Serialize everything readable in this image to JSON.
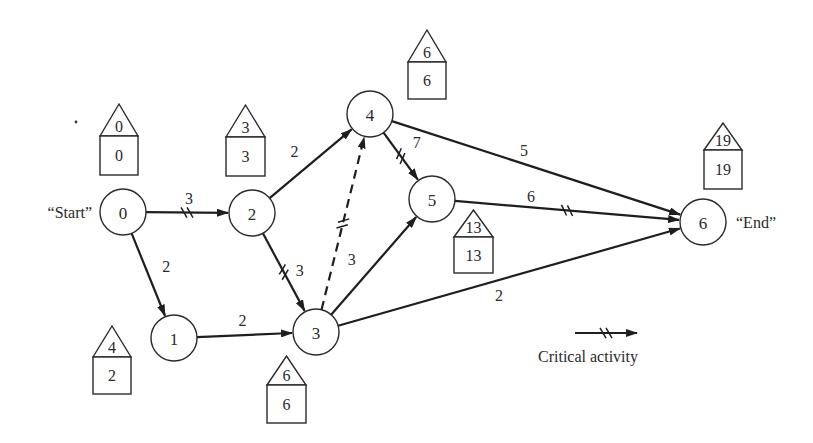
{
  "diagram": {
    "type": "critical-path-network",
    "colors": {
      "ink": "#1e1e1e",
      "background": "#ffffff"
    },
    "nodes": [
      {
        "id": "0",
        "label": "0",
        "x": 123,
        "y": 212,
        "side_label": "“Start”",
        "side": "left",
        "house": {
          "x": 100,
          "top": 104,
          "roof_base": 136,
          "bottom": 175,
          "width": 38,
          "late": "0",
          "early": "0"
        }
      },
      {
        "id": "1",
        "label": "1",
        "x": 174,
        "y": 338,
        "house": {
          "x": 93,
          "top": 326,
          "roof_base": 357,
          "bottom": 394,
          "width": 38,
          "late": "4",
          "early": "2"
        }
      },
      {
        "id": "2",
        "label": "2",
        "x": 252,
        "y": 213,
        "house": {
          "x": 226,
          "top": 105,
          "roof_base": 137,
          "bottom": 176,
          "width": 39,
          "late": "3",
          "early": "3"
        }
      },
      {
        "id": "3",
        "label": "3",
        "x": 316,
        "y": 332,
        "house": {
          "x": 267,
          "top": 356,
          "roof_base": 385,
          "bottom": 423,
          "width": 39,
          "late": "6",
          "early": "6"
        }
      },
      {
        "id": "4",
        "label": "4",
        "x": 370,
        "y": 114,
        "house": {
          "x": 408,
          "top": 30,
          "roof_base": 62,
          "bottom": 99,
          "width": 38,
          "late": "6",
          "early": "6"
        }
      },
      {
        "id": "5",
        "label": "5",
        "x": 432,
        "y": 199,
        "house": {
          "x": 454,
          "top": 210,
          "roof_base": 237,
          "bottom": 273,
          "width": 39,
          "late": "13",
          "early": "13"
        }
      },
      {
        "id": "6",
        "label": "6",
        "x": 703,
        "y": 222,
        "side_label": "“End”",
        "side": "right",
        "house": {
          "x": 704,
          "top": 123,
          "roof_base": 150,
          "bottom": 189,
          "width": 38,
          "late": "19",
          "early": "19"
        }
      }
    ],
    "node_radius": 23,
    "edges": [
      {
        "from": "0",
        "to": "2",
        "duration": "3",
        "critical": true,
        "dashed": false,
        "label_dx": 2,
        "label_dy": -14
      },
      {
        "from": "0",
        "to": "1",
        "duration": "2",
        "critical": false,
        "dashed": false,
        "label_dx": 18,
        "label_dy": -8
      },
      {
        "from": "2",
        "to": "4",
        "duration": "2",
        "critical": false,
        "dashed": false,
        "label_dx": -16,
        "label_dy": -12
      },
      {
        "from": "2",
        "to": "3",
        "duration": "3",
        "critical": true,
        "dashed": false,
        "label_dx": 16,
        "label_dy": -2
      },
      {
        "from": "1",
        "to": "3",
        "duration": "2",
        "critical": false,
        "dashed": false,
        "label_dx": -2,
        "label_dy": -15
      },
      {
        "from": "3",
        "to": "4",
        "duration": "",
        "critical": true,
        "dashed": true,
        "label_dx": 0,
        "label_dy": 0
      },
      {
        "from": "4",
        "to": "5",
        "duration": "7",
        "critical": true,
        "dashed": false,
        "label_dx": 16,
        "label_dy": -14
      },
      {
        "from": "3",
        "to": "5",
        "duration": "3",
        "critical": false,
        "dashed": false,
        "label_dx": -22,
        "label_dy": -6
      },
      {
        "from": "4",
        "to": "6",
        "duration": "5",
        "critical": false,
        "dashed": false,
        "label_dx": -12,
        "label_dy": -17
      },
      {
        "from": "5",
        "to": "6",
        "duration": "6",
        "critical": true,
        "dashed": false,
        "label_dx": -36,
        "label_dy": -14
      },
      {
        "from": "3",
        "to": "6",
        "duration": "2",
        "critical": false,
        "dashed": false,
        "label_dx": -10,
        "label_dy": 18
      }
    ],
    "legend": {
      "label": "Critical activity",
      "arrow": {
        "x1": 575,
        "x2": 637,
        "y": 333
      },
      "label_x": 538,
      "label_y": 362
    },
    "stray_dot": {
      "x": 76,
      "y": 122
    }
  }
}
